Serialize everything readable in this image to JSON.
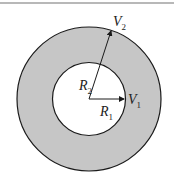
{
  "diagram": {
    "type": "annulus",
    "colors": {
      "ring_fill": "#c6c6c6",
      "inner_fill": "#ffffff",
      "stroke": "#1a1a1a",
      "top_rule": "#b8b8b8"
    },
    "labels": {
      "r1": {
        "main": "R",
        "sub": "1"
      },
      "r2": {
        "main": "R",
        "sub": "2"
      },
      "v1": {
        "main": "V",
        "sub": "1"
      },
      "v2": {
        "main": "V",
        "sub": "2"
      }
    }
  }
}
